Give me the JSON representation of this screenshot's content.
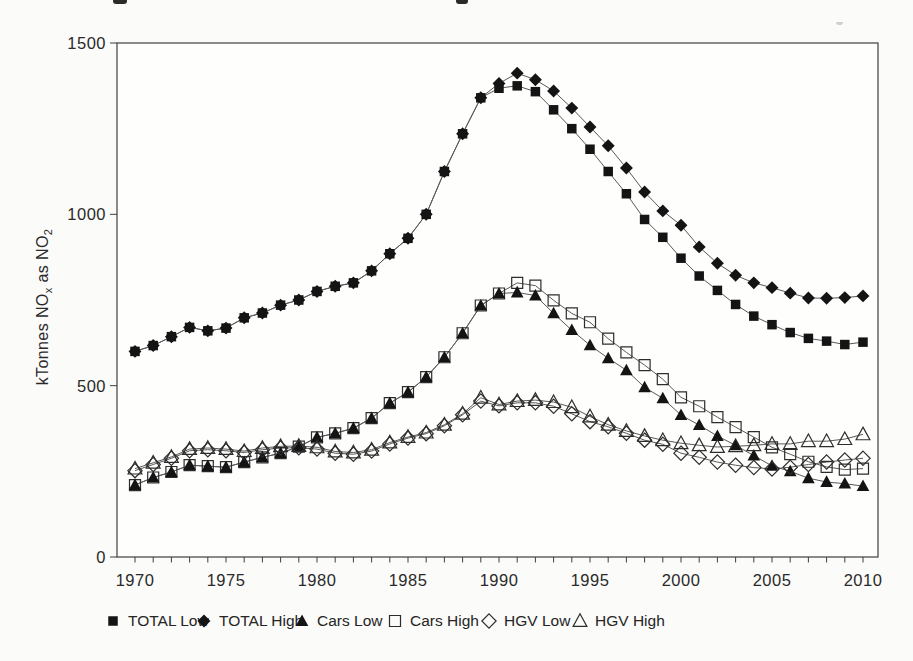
{
  "figure": {
    "note_top_edge": "cropped title fragments visible at top edge (unreadable)"
  },
  "chart_data": {
    "type": "line",
    "title": "",
    "xlabel": "",
    "ylabel": "kTonnes NOx as NO2",
    "ylabel_parts": {
      "p1": "kTonnes NO",
      "s1": "x",
      "p2": " as NO",
      "s2": "2"
    },
    "grid": false,
    "legend_position": "bottom",
    "xlim": [
      1970,
      2010
    ],
    "ylim": [
      0,
      1500
    ],
    "yticks": [
      0,
      500,
      1000,
      1500
    ],
    "xticks": [
      1970,
      1975,
      1980,
      1985,
      1990,
      1995,
      2000,
      2005,
      2010
    ],
    "x": [
      1970,
      1971,
      1972,
      1973,
      1974,
      1975,
      1976,
      1977,
      1978,
      1979,
      1980,
      1981,
      1982,
      1983,
      1984,
      1985,
      1986,
      1987,
      1988,
      1989,
      1990,
      1991,
      1992,
      1993,
      1994,
      1995,
      1996,
      1997,
      1998,
      1999,
      2000,
      2001,
      2002,
      2003,
      2004,
      2005,
      2006,
      2007,
      2008,
      2009,
      2010
    ],
    "series": [
      {
        "name": "TOTAL Low",
        "marker": "square",
        "style": "filled",
        "values": [
          600,
          617,
          643,
          670,
          660,
          668,
          698,
          712,
          735,
          750,
          775,
          790,
          800,
          835,
          885,
          930,
          1000,
          1125,
          1235,
          1340,
          1368,
          1375,
          1358,
          1305,
          1250,
          1190,
          1125,
          1060,
          985,
          933,
          872,
          820,
          778,
          737,
          703,
          678,
          655,
          638,
          630,
          620,
          627
        ]
      },
      {
        "name": "TOTAL High",
        "marker": "diamond",
        "style": "filled",
        "values": [
          600,
          617,
          643,
          670,
          660,
          668,
          698,
          712,
          735,
          750,
          775,
          790,
          800,
          835,
          885,
          930,
          1000,
          1125,
          1235,
          1340,
          1382,
          1412,
          1393,
          1360,
          1310,
          1255,
          1200,
          1135,
          1065,
          1010,
          968,
          905,
          857,
          822,
          800,
          786,
          770,
          756,
          755,
          757,
          762
        ]
      },
      {
        "name": "Cars Low",
        "marker": "triangle",
        "style": "filled",
        "values": [
          210,
          232,
          248,
          268,
          265,
          262,
          277,
          291,
          303,
          322,
          349,
          361,
          376,
          405,
          449,
          481,
          525,
          583,
          653,
          734,
          769,
          772,
          763,
          711,
          662,
          618,
          580,
          545,
          495,
          463,
          414,
          385,
          353,
          326,
          296,
          266,
          250,
          230,
          219,
          214,
          207
        ]
      },
      {
        "name": "Cars High",
        "marker": "square",
        "style": "open",
        "values": [
          210,
          232,
          248,
          268,
          265,
          262,
          277,
          291,
          303,
          322,
          349,
          361,
          376,
          405,
          449,
          481,
          525,
          583,
          653,
          734,
          769,
          800,
          792,
          749,
          711,
          685,
          637,
          597,
          560,
          519,
          466,
          440,
          408,
          379,
          350,
          320,
          300,
          278,
          263,
          255,
          258
        ]
      },
      {
        "name": "HGV Low",
        "marker": "diamond",
        "style": "open",
        "values": [
          252,
          270,
          288,
          310,
          313,
          310,
          305,
          313,
          318,
          319,
          315,
          303,
          300,
          309,
          330,
          347,
          360,
          383,
          415,
          455,
          441,
          450,
          450,
          440,
          418,
          395,
          380,
          361,
          341,
          329,
          303,
          291,
          277,
          268,
          261,
          257,
          262,
          270,
          277,
          283,
          288
        ]
      },
      {
        "name": "HGV High",
        "marker": "triangle",
        "style": "open",
        "values": [
          258,
          275,
          292,
          315,
          318,
          315,
          309,
          318,
          323,
          324,
          320,
          308,
          305,
          313,
          334,
          350,
          363,
          386,
          418,
          465,
          445,
          455,
          458,
          452,
          437,
          410,
          386,
          368,
          353,
          341,
          332,
          326,
          321,
          323,
          326,
          330,
          330,
          338,
          338,
          344,
          358
        ]
      }
    ]
  },
  "legend": {
    "items": [
      "TOTAL Low",
      "TOTAL High",
      "Cars Low",
      "Cars High",
      "HGV Low",
      "HGV High"
    ]
  },
  "colors": {
    "ink": "#141414",
    "line": "#595959",
    "frame": "#3f3f3f",
    "paper": "#fbfbf9"
  }
}
